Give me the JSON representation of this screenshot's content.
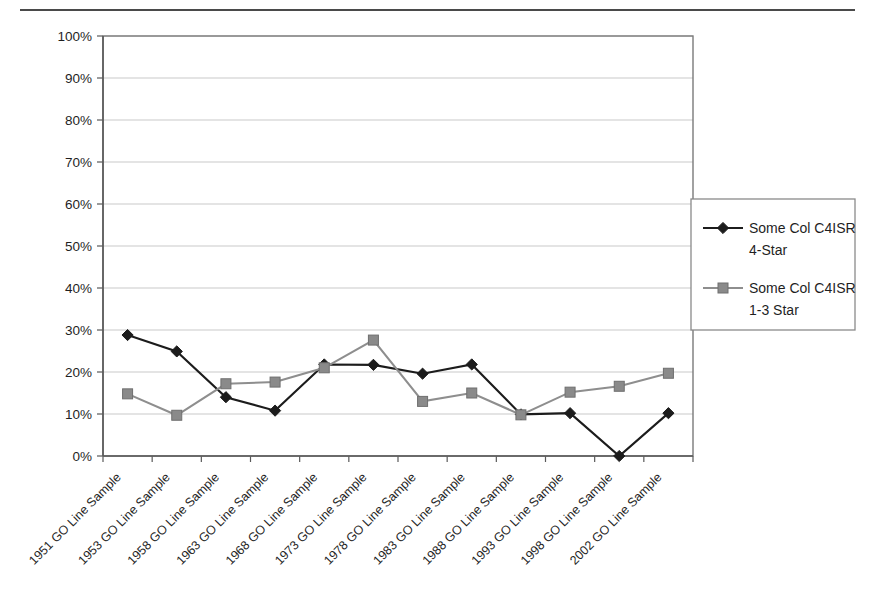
{
  "chart_data": {
    "type": "line",
    "title": "",
    "subtitle": "",
    "xlabel": "",
    "ylabel": "",
    "ylim": [
      0,
      100
    ],
    "ytick_labels": [
      "100%",
      "90%",
      "80%",
      "70%",
      "60%",
      "50%",
      "40%",
      "30%",
      "20%",
      "10%",
      "0%"
    ],
    "ytick_values": [
      100,
      90,
      80,
      70,
      60,
      50,
      40,
      30,
      20,
      10,
      0
    ],
    "grid": true,
    "legend_position": "right",
    "categories": [
      "1951 GO Line Sample",
      "1953 GO Line Sample",
      "1958 GO Line Sample",
      "1963 GO Line Sample",
      "1968 GO Line Sample",
      "1973 GO Line Sample",
      "1978 GO Line Sample",
      "1983 GO Line Sample",
      "1988 GO Line Sample",
      "1993 GO Line Sample",
      "1998 GO Line Sample",
      "2002 GO Line Sample"
    ],
    "series": [
      {
        "name": "Some Col C4ISR 4-Star",
        "marker": "diamond",
        "color": "#1c1c1c",
        "values": [
          28.8,
          24.9,
          14.0,
          10.8,
          21.8,
          21.7,
          19.6,
          21.8,
          9.9,
          10.2,
          0.0,
          10.2
        ]
      },
      {
        "name": "Some Col C4ISR 1-3 Star",
        "marker": "square",
        "color": "#8a8a8a",
        "values": [
          14.8,
          9.7,
          17.2,
          17.6,
          21.0,
          27.6,
          13.0,
          15.0,
          9.8,
          15.2,
          16.6,
          19.7
        ]
      }
    ]
  },
  "legend": {
    "entries": [
      {
        "label_line1": "Some Col C4ISR",
        "label_line2": "4-Star"
      },
      {
        "label_line1": "Some Col C4ISR",
        "label_line2": "1-3 Star"
      }
    ]
  },
  "colors": {
    "series_a": "#1c1c1c",
    "series_b": "#8a8a8a",
    "grid": "#c9c9c9",
    "axis": "#595959",
    "background": "#ffffff"
  }
}
